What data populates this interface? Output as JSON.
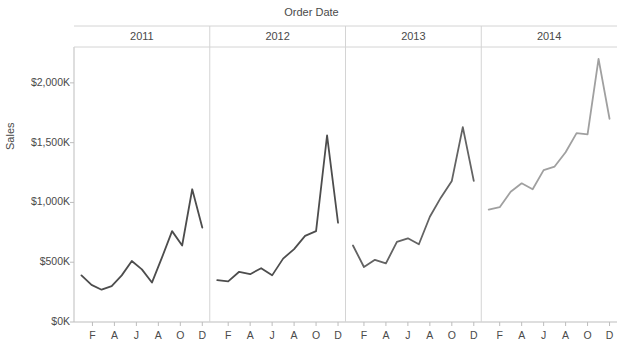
{
  "chart_data": {
    "type": "line",
    "title": "Order Date",
    "xlabel": "",
    "ylabel": "Sales",
    "ylim": [
      0,
      2300
    ],
    "y_ticks": [
      {
        "value": 0,
        "label": "$0K"
      },
      {
        "value": 500,
        "label": "$500K"
      },
      {
        "value": 1000,
        "label": "$1,000K"
      },
      {
        "value": 1500,
        "label": "$1,500K"
      },
      {
        "value": 2000,
        "label": "$2,000K"
      }
    ],
    "x_tick_labels": [
      "F",
      "A",
      "J",
      "A",
      "O",
      "D"
    ],
    "x_tick_months": [
      2,
      4,
      6,
      8,
      10,
      12
    ],
    "grid": false,
    "legend": "none",
    "panels": [
      {
        "label": "2011",
        "color": "#4d4d4d",
        "months": [
          1,
          2,
          3,
          4,
          5,
          6,
          7,
          8,
          9,
          10,
          11,
          12
        ],
        "values": [
          390,
          310,
          270,
          300,
          390,
          510,
          440,
          330,
          540,
          760,
          640,
          1110,
          790
        ]
      },
      {
        "label": "2012",
        "color": "#4d4d4d",
        "months": [
          1,
          2,
          3,
          4,
          5,
          6,
          7,
          8,
          9,
          10,
          11,
          12
        ],
        "values": [
          350,
          340,
          420,
          400,
          450,
          390,
          530,
          610,
          720,
          760,
          1560,
          830
        ]
      },
      {
        "label": "2013",
        "color": "#636363",
        "months": [
          1,
          2,
          3,
          4,
          5,
          6,
          7,
          8,
          9,
          10,
          11,
          12
        ],
        "values": [
          640,
          460,
          520,
          490,
          670,
          700,
          650,
          880,
          1040,
          1180,
          1630,
          1180
        ]
      },
      {
        "label": "2014",
        "color": "#a0a0a0",
        "months": [
          1,
          2,
          3,
          4,
          5,
          6,
          7,
          8,
          9,
          10,
          11,
          12
        ],
        "values": [
          940,
          960,
          1090,
          1160,
          1110,
          1270,
          1300,
          1420,
          1580,
          1570,
          2200,
          1700
        ]
      }
    ]
  }
}
